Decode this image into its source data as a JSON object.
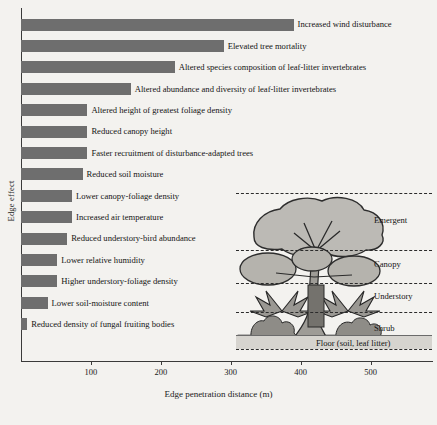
{
  "chart_data": {
    "type": "bar",
    "orientation": "horizontal",
    "title": "",
    "xlabel": "Edge penetration distance (m)",
    "ylabel": "Edge effect",
    "xlim": [
      0,
      580
    ],
    "xticks": [
      100,
      200,
      300,
      400,
      500
    ],
    "xticklabels": [
      "100",
      "200",
      "300",
      "400",
      "500"
    ],
    "grid": false,
    "legend": "none",
    "bar_color": "#6e6e6e",
    "categories": [
      "Increased wind disturbance",
      "Elevated tree mortality",
      "Altered species composition of leaf-litter invertebrates",
      "Altered abundance and diversity of leaf-litter invertebrates",
      "Altered height of greatest foliage density",
      "Reduced canopy height",
      "Faster recruitment of disturbance-adapted trees",
      "Reduced soil moisture",
      "Lower canopy-foliage density",
      "Increased air temperature",
      "Reduced understory-bird abundance",
      "Lower relative humidity",
      "Higher understory-foliage density",
      "Lower soil-moisture content",
      "Reduced density of fungal fruiting bodies"
    ],
    "values": [
      390,
      290,
      220,
      157,
      95,
      95,
      95,
      88,
      73,
      73,
      66,
      52,
      52,
      38,
      9
    ]
  },
  "axis": {
    "ylabel": "Edge effect",
    "xlabel": "Edge penetration distance (m)",
    "ticks": [
      {
        "value": 100,
        "label": "100"
      },
      {
        "value": 200,
        "label": "200"
      },
      {
        "value": 300,
        "label": "300"
      },
      {
        "value": 400,
        "label": "400"
      },
      {
        "value": 500,
        "label": "500"
      }
    ]
  },
  "inset": {
    "strata": [
      {
        "label": "Emergent"
      },
      {
        "label": "Canopy"
      },
      {
        "label": "Understory"
      },
      {
        "label": "Shrub"
      }
    ],
    "floor_label": "Floor (soil, leaf litter)"
  }
}
